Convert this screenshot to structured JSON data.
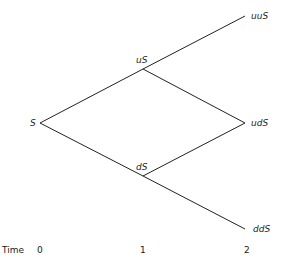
{
  "diagram": {
    "type": "binomial-tree",
    "stroke_color": "#222222",
    "nodes": {
      "s": {
        "label": "S",
        "x": 40,
        "y": 123
      },
      "us": {
        "label": "uS",
        "x": 143,
        "y": 69
      },
      "ds": {
        "label": "dS",
        "x": 143,
        "y": 176
      },
      "uus": {
        "label": "uuS",
        "x": 245,
        "y": 16
      },
      "uds": {
        "label": "udS",
        "x": 245,
        "y": 123
      },
      "dds": {
        "label": "ddS",
        "x": 245,
        "y": 229
      }
    },
    "edges": [
      {
        "from": "s",
        "to": "us"
      },
      {
        "from": "s",
        "to": "ds"
      },
      {
        "from": "us",
        "to": "uus"
      },
      {
        "from": "us",
        "to": "uds"
      },
      {
        "from": "ds",
        "to": "uds"
      },
      {
        "from": "ds",
        "to": "dds"
      }
    ],
    "time_axis": {
      "label": "Time",
      "ticks": [
        "0",
        "1",
        "2"
      ]
    }
  }
}
